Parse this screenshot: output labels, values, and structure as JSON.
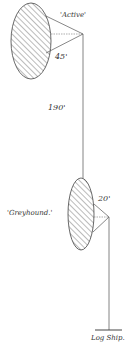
{
  "diagram": {
    "kites": [
      {
        "name": "Active",
        "label": "'Active'",
        "line_length_label": "45'"
      },
      {
        "name": "Greyhound",
        "label": "'Greyhound.'",
        "line_length_label": "20'"
      }
    ],
    "connecting_line_label": "190'",
    "anchor_label": "Log Ship.",
    "colors": {
      "ink": "#333333",
      "background": "#ffffff"
    }
  }
}
